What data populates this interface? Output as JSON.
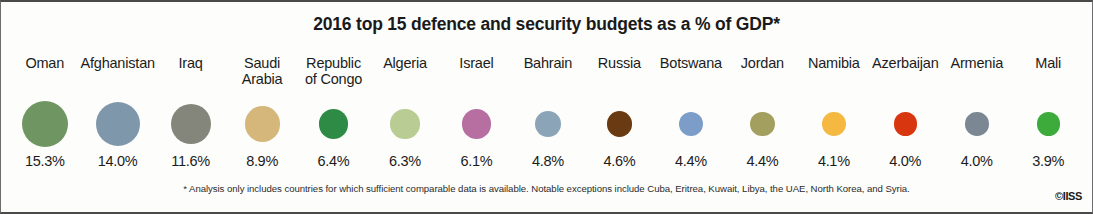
{
  "chart_data": {
    "type": "bar",
    "title": "2016 top 15 defence and security budgets as a % of GDP*",
    "xlabel": "",
    "ylabel": "",
    "unit": "% of GDP",
    "categories": [
      "Oman",
      "Afghanistan",
      "Iraq",
      "Saudi\nArabia",
      "Republic\nof Congo",
      "Algeria",
      "Israel",
      "Bahrain",
      "Russia",
      "Botswana",
      "Jordan",
      "Namibia",
      "Azerbaijan",
      "Armenia",
      "Mali"
    ],
    "values": [
      15.3,
      14.0,
      11.6,
      8.9,
      6.4,
      6.3,
      6.1,
      4.8,
      4.6,
      4.4,
      4.4,
      4.1,
      4.0,
      4.0,
      3.9
    ],
    "value_labels": [
      "15.3%",
      "14.0%",
      "11.6%",
      "8.9%",
      "6.4%",
      "6.3%",
      "6.1%",
      "4.8%",
      "4.6%",
      "4.4%",
      "4.4%",
      "4.1%",
      "4.0%",
      "4.0%",
      "3.9%"
    ],
    "colors": [
      "#6f9563",
      "#7f97ab",
      "#85867b",
      "#d5b77b",
      "#2d8b46",
      "#b9cc93",
      "#b76fa2",
      "#8ba4b7",
      "#6a3a13",
      "#7c9dc8",
      "#a3a05f",
      "#f5b942",
      "#d8360f",
      "#7b8894",
      "#3cab3c"
    ],
    "marker": "circle-area-proportional",
    "grid": false,
    "legend": false
  },
  "footnote": "* Analysis only includes countries for which sufficient comparable data is available. Notable exceptions include Cuba, Eritrea, Kuwait, Libya, the UAE, North Korea, and Syria.",
  "credit": "©IISS"
}
